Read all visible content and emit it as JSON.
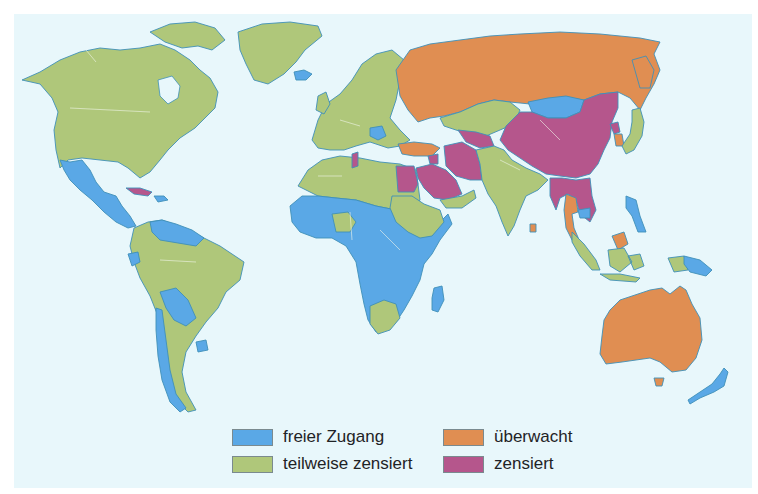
{
  "map": {
    "background_color": "#e8f7fb",
    "categories": {
      "free": {
        "label": "freier Zugang",
        "color": "#5aa8e6"
      },
      "partly": {
        "label": "teilweise zensiert",
        "color": "#afc77a"
      },
      "monitored": {
        "label": "überwacht",
        "color": "#e08e52"
      },
      "censored": {
        "label": "zensiert",
        "color": "#b5568c"
      }
    },
    "regions": [
      {
        "name": "North America (Canada, USA)",
        "category": "partly"
      },
      {
        "name": "Greenland",
        "category": "partly"
      },
      {
        "name": "Mexico & Central America",
        "category": "free"
      },
      {
        "name": "Cuba",
        "category": "censored"
      },
      {
        "name": "Caribbean",
        "category": "free"
      },
      {
        "name": "Venezuela/Guyanas",
        "category": "free"
      },
      {
        "name": "Ecuador, Bolivia, Paraguay, Uruguay, Chile",
        "category": "free"
      },
      {
        "name": "Brazil, Colombia, Peru, Argentina",
        "category": "partly"
      },
      {
        "name": "Europe",
        "category": "partly"
      },
      {
        "name": "Iceland",
        "category": "free"
      },
      {
        "name": "Balkans",
        "category": "free"
      },
      {
        "name": "Russia",
        "category": "monitored"
      },
      {
        "name": "Turkey",
        "category": "monitored"
      },
      {
        "name": "Central Asia (Kazakhstan)",
        "category": "partly"
      },
      {
        "name": "Turkmenistan / Uzbekistan",
        "category": "censored"
      },
      {
        "name": "Iran",
        "category": "censored"
      },
      {
        "name": "Saudi Arabia",
        "category": "censored"
      },
      {
        "name": "Egypt",
        "category": "censored"
      },
      {
        "name": "Tunisia",
        "category": "censored"
      },
      {
        "name": "Syria",
        "category": "censored"
      },
      {
        "name": "North Africa (Algeria, Libya, Morocco)",
        "category": "partly"
      },
      {
        "name": "Sub-Saharan Africa",
        "category": "free"
      },
      {
        "name": "Nigeria, Sudan, Ethiopia, South Africa",
        "category": "partly"
      },
      {
        "name": "Madagascar",
        "category": "free"
      },
      {
        "name": "India, Pakistan, Afghanistan",
        "category": "partly"
      },
      {
        "name": "Sri Lanka",
        "category": "monitored"
      },
      {
        "name": "Mongolia",
        "category": "free"
      },
      {
        "name": "China",
        "category": "censored"
      },
      {
        "name": "North Korea",
        "category": "censored"
      },
      {
        "name": "South Korea",
        "category": "monitored"
      },
      {
        "name": "Japan",
        "category": "partly"
      },
      {
        "name": "Myanmar / Vietnam",
        "category": "censored"
      },
      {
        "name": "Thailand",
        "category": "monitored"
      },
      {
        "name": "Cambodia",
        "category": "free"
      },
      {
        "name": "Malaysia",
        "category": "monitored"
      },
      {
        "name": "Indonesia",
        "category": "partly"
      },
      {
        "name": "Philippines",
        "category": "free"
      },
      {
        "name": "Papua New Guinea",
        "category": "free"
      },
      {
        "name": "Australia",
        "category": "monitored"
      },
      {
        "name": "New Zealand",
        "category": "free"
      }
    ]
  },
  "legend": {
    "items": [
      {
        "label": "freier Zugang",
        "color": "#5aa8e6"
      },
      {
        "label": "teilweise zensiert",
        "color": "#afc77a"
      },
      {
        "label": "überwacht",
        "color": "#e08e52"
      },
      {
        "label": "zensiert",
        "color": "#b5568c"
      }
    ]
  }
}
